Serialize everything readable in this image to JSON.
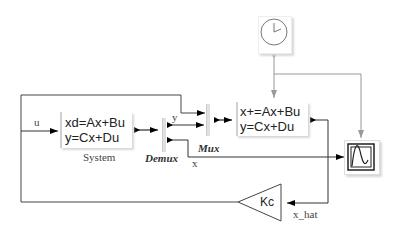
{
  "diagram": {
    "blocks": {
      "system": {
        "eq1": "xd=Ax+Bu",
        "eq2": "y=Cx+Du",
        "label": "System"
      },
      "demux": {
        "label": "Demux"
      },
      "mux": {
        "label": "Mux"
      },
      "observer": {
        "eq1": "x+=Ax+Bu",
        "eq2": "y=Cx+Du"
      },
      "clock": {
        "icon": "clock-icon"
      },
      "scope": {
        "icon": "scope-icon"
      },
      "gain": {
        "label": "Kc"
      }
    },
    "signals": {
      "u": "u",
      "y": "y",
      "x": "x",
      "x_hat": "x_hat"
    }
  }
}
